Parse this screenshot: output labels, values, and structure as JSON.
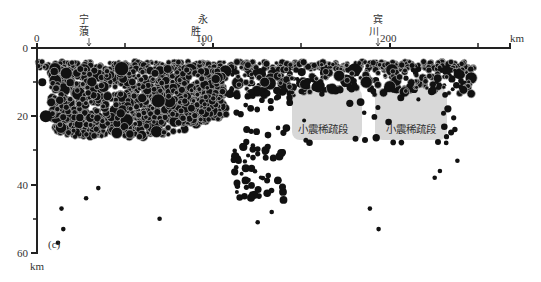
{
  "chart_data": {
    "type": "scatter",
    "title": "",
    "panel_label": "(c)",
    "xlabel": "km",
    "ylabel": "km",
    "xlim": [
      0,
      270
    ],
    "ylim": [
      60,
      0
    ],
    "x_ticks": [
      0,
      50,
      100,
      150,
      200,
      250
    ],
    "x_tick_labels": [
      "0",
      "",
      "100",
      "",
      "200",
      ""
    ],
    "y_ticks": [
      0,
      10,
      20,
      30,
      40,
      50,
      60
    ],
    "y_tick_labels": [
      "0",
      "",
      "20",
      "",
      "40",
      "",
      "60"
    ],
    "grid": false,
    "place_markers": [
      {
        "name": "宁蒗",
        "x": 28
      },
      {
        "name": "永胜",
        "x": 95
      },
      {
        "name": "宾川",
        "x": 195
      }
    ],
    "annotations": [
      {
        "text": "小震稀疏段",
        "x_range": [
          145,
          183
        ],
        "depth_range": [
          12,
          27
        ]
      },
      {
        "text": "小震稀疏段",
        "x_range": [
          192,
          232
        ],
        "depth_range": [
          12,
          27
        ]
      }
    ],
    "series": [
      {
        "name": "earthquake hypocenters",
        "marker": "filled circle, size by magnitude",
        "description": "Dense cluster 0-110 km at depths 3-28 km; continuous shallow band ~5 km depth across 0-240 km; sparse deeper events 30-57 km; two gaps (小震稀疏段) near 145-183 km and 192-232 km at 12-27 km depth"
      }
    ]
  },
  "axis": {
    "x_zero": "0",
    "x_100": "100",
    "x_200": "200",
    "x_unit": "km",
    "y_0": "0",
    "y_20": "20",
    "y_40": "40",
    "y_60": "60",
    "y_unit": "km"
  },
  "places": {
    "ninglang_1": "宁",
    "ninglang_2": "蒗",
    "yongsheng_1": "永",
    "yongsheng_2": "胜",
    "binchuan_1": "宾",
    "binchuan_2": "川"
  },
  "gap_label_1": "小震稀疏段",
  "gap_label_2": "小震稀疏段",
  "panel_label": "(c)"
}
